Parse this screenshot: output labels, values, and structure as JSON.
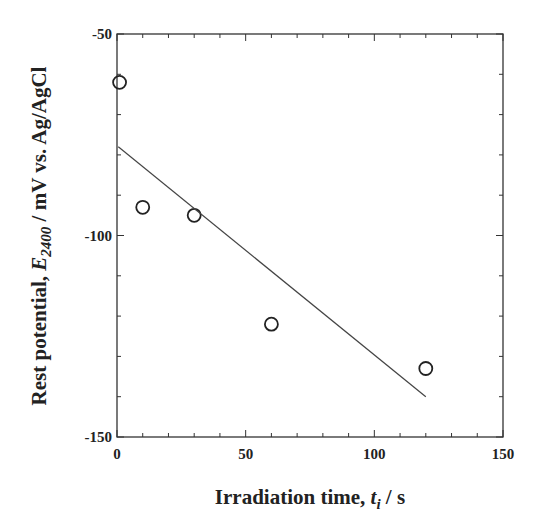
{
  "chart_data": {
    "type": "scatter",
    "title": "",
    "xlabel": "Irradiation time, t_i / s",
    "xlabel_parts": {
      "main": "Irradiation time, ",
      "var": "t",
      "sub": "i",
      "tail": " / s"
    },
    "ylabel": "Rest potential, E_2400 / mV vs. Ag/AgCl",
    "ylabel_parts": {
      "main": "Rest potential, ",
      "var": "E",
      "sub": "2400",
      "tail": " / mV vs. Ag/AgCl"
    },
    "xlim": [
      0,
      150
    ],
    "ylim": [
      -150,
      -50
    ],
    "x_major_ticks": [
      0,
      50,
      100,
      150
    ],
    "x_minor_step": 10,
    "y_major_ticks": [
      -50,
      -100,
      -150
    ],
    "y_minor_step": 10,
    "grid": false,
    "legend": null,
    "series": [
      {
        "name": "measured",
        "marker": "open-circle",
        "x": [
          1,
          10,
          30,
          60,
          120
        ],
        "y": [
          -62,
          -93,
          -95,
          -122,
          -133
        ]
      },
      {
        "name": "linear fit",
        "style": "line",
        "x": [
          0.5,
          120
        ],
        "y": [
          -78,
          -140
        ]
      }
    ]
  },
  "colors": {
    "axis": "#333333",
    "marker": "#222222",
    "line": "#444444"
  }
}
